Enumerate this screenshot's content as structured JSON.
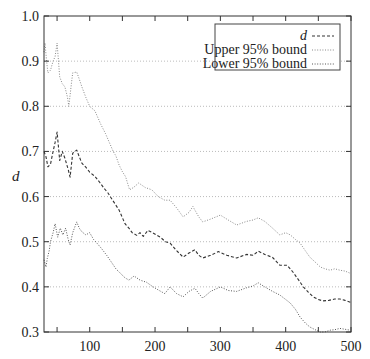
{
  "chart_data": {
    "type": "line",
    "title": "",
    "xlabel": "",
    "ylabel": "d",
    "xlim": [
      30,
      500
    ],
    "ylim": [
      0.3,
      1.0
    ],
    "xticks": [
      100,
      200,
      300,
      400,
      500
    ],
    "xtick_labels": [
      "100",
      "200",
      "300",
      "400",
      "500"
    ],
    "xminor_ticks": [
      50,
      150,
      250,
      350,
      450
    ],
    "yticks": [
      0.3,
      0.4,
      0.5,
      0.6,
      0.7,
      0.8,
      0.9,
      1.0
    ],
    "ytick_labels": [
      "0.3",
      "0.4",
      "0.5",
      "0.6",
      "0.7",
      "0.8",
      "0.9",
      "1.0"
    ],
    "grid": "horizontal-dotted",
    "legend_position": "top-right",
    "series": [
      {
        "name": "d",
        "style": "dashed",
        "color": "#333333",
        "x": [
          30,
          33,
          36,
          40,
          44,
          47,
          50,
          54,
          58,
          62,
          67,
          70,
          74,
          80,
          84,
          88,
          94,
          100,
          108,
          116,
          122,
          128,
          136,
          145,
          154,
          160,
          165,
          172,
          177,
          182,
          189,
          196,
          208,
          216,
          223,
          233,
          243,
          252,
          261,
          267,
          273,
          285,
          297,
          310,
          325,
          340,
          350,
          358,
          368,
          380,
          391,
          402,
          411,
          420,
          427,
          435,
          442,
          450,
          457,
          466,
          475,
          483,
          491,
          499
        ],
        "y": [
          0.7,
          0.688,
          0.666,
          0.672,
          0.7,
          0.72,
          0.743,
          0.68,
          0.7,
          0.685,
          0.66,
          0.643,
          0.696,
          0.703,
          0.688,
          0.674,
          0.665,
          0.654,
          0.645,
          0.63,
          0.618,
          0.608,
          0.59,
          0.57,
          0.54,
          0.53,
          0.52,
          0.514,
          0.52,
          0.512,
          0.525,
          0.52,
          0.51,
          0.5,
          0.497,
          0.48,
          0.466,
          0.475,
          0.482,
          0.47,
          0.464,
          0.47,
          0.478,
          0.47,
          0.464,
          0.472,
          0.47,
          0.479,
          0.472,
          0.465,
          0.448,
          0.448,
          0.433,
          0.415,
          0.4,
          0.388,
          0.378,
          0.372,
          0.369,
          0.37,
          0.373,
          0.373,
          0.37,
          0.366
        ]
      },
      {
        "name": "Upper 95% bound",
        "style": "dotted",
        "color": "#888888",
        "x": [
          30,
          31.5,
          34,
          36,
          40,
          44,
          47,
          50,
          54,
          58,
          62,
          66,
          68,
          72,
          74,
          80,
          84,
          88,
          94,
          100,
          108,
          117,
          124,
          130,
          136,
          140,
          145,
          150,
          155,
          161,
          167,
          175,
          185,
          195,
          205,
          215,
          223,
          233,
          243,
          252,
          258,
          261,
          267,
          273,
          285,
          300,
          312,
          325,
          340,
          350,
          358,
          368,
          380,
          391,
          400,
          407,
          415,
          422,
          430,
          437,
          445,
          453,
          460,
          468,
          475,
          483,
          491,
          499
        ],
        "y": [
          0.92,
          0.94,
          0.9,
          0.874,
          0.88,
          0.9,
          0.91,
          0.94,
          0.865,
          0.85,
          0.843,
          0.82,
          0.8,
          0.85,
          0.874,
          0.876,
          0.86,
          0.843,
          0.82,
          0.8,
          0.79,
          0.76,
          0.74,
          0.72,
          0.7,
          0.69,
          0.67,
          0.655,
          0.644,
          0.615,
          0.62,
          0.63,
          0.62,
          0.615,
          0.6,
          0.592,
          0.592,
          0.575,
          0.555,
          0.565,
          0.578,
          0.57,
          0.555,
          0.544,
          0.55,
          0.559,
          0.548,
          0.537,
          0.545,
          0.548,
          0.553,
          0.545,
          0.53,
          0.515,
          0.52,
          0.515,
          0.505,
          0.497,
          0.48,
          0.466,
          0.455,
          0.444,
          0.44,
          0.437,
          0.44,
          0.437,
          0.435,
          0.43
        ]
      },
      {
        "name": "Lower 95% bound",
        "style": "dotted",
        "color": "#555555",
        "x": [
          30,
          33,
          35,
          38,
          40,
          44,
          47,
          51,
          55,
          59,
          63,
          67,
          70,
          74,
          80,
          84,
          88,
          94,
          100,
          106,
          111,
          118,
          126,
          133,
          140,
          147,
          154,
          160,
          168,
          177,
          187,
          195,
          205,
          215,
          223,
          233,
          243,
          252,
          261,
          267,
          273,
          285,
          300,
          312,
          325,
          340,
          350,
          358,
          368,
          380,
          391,
          400,
          407,
          415,
          422,
          430,
          437,
          445,
          453,
          460,
          468,
          475,
          483,
          491,
          499
        ],
        "y": [
          0.46,
          0.444,
          0.463,
          0.48,
          0.5,
          0.52,
          0.54,
          0.51,
          0.53,
          0.515,
          0.53,
          0.505,
          0.493,
          0.52,
          0.544,
          0.53,
          0.522,
          0.515,
          0.52,
          0.505,
          0.497,
          0.485,
          0.47,
          0.455,
          0.44,
          0.43,
          0.42,
          0.415,
          0.424,
          0.415,
          0.41,
          0.402,
          0.393,
          0.385,
          0.4,
          0.385,
          0.378,
          0.39,
          0.397,
          0.385,
          0.375,
          0.39,
          0.4,
          0.392,
          0.39,
          0.398,
          0.402,
          0.409,
          0.4,
          0.39,
          0.382,
          0.372,
          0.364,
          0.35,
          0.333,
          0.32,
          0.311,
          0.305,
          0.3,
          0.3,
          0.304,
          0.305,
          0.308,
          0.306,
          0.304
        ]
      }
    ]
  }
}
